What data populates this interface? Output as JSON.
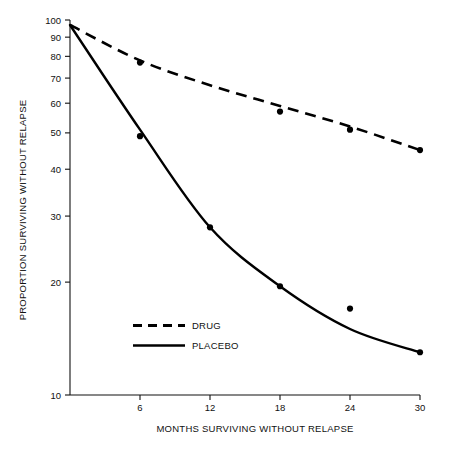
{
  "chart_data": {
    "type": "line",
    "title": "",
    "xlabel": "MONTHS SURVIVING WITHOUT RELAPSE",
    "ylabel": "PROPORTION SURVIVING WITHOUT RELAPSE",
    "yscale": "log",
    "xscale": "linear",
    "xlim": [
      0,
      30
    ],
    "ylim": [
      10,
      100
    ],
    "grid": false,
    "legend_position": "lower-left-inside",
    "x_ticks": [
      6,
      12,
      18,
      24,
      30
    ],
    "x_tick_labels": [
      "6",
      "12",
      "18",
      "24",
      "30"
    ],
    "y_ticks": [
      10,
      20,
      30,
      40,
      50,
      60,
      70,
      80,
      90,
      100
    ],
    "y_tick_labels": [
      "10",
      "20",
      "30",
      "40",
      "50",
      "60",
      "70",
      "80",
      "90",
      "100"
    ],
    "x": [
      0,
      6,
      12,
      18,
      24,
      30
    ],
    "series": [
      {
        "name": "DRUG",
        "style": "dashed",
        "color": "#000000",
        "fit_x": [
          0,
          6,
          12,
          18,
          24,
          30
        ],
        "fit_values": [
          97,
          78,
          67,
          59,
          52,
          45
        ],
        "points_x": [
          6,
          18,
          24,
          30
        ],
        "points_values": [
          77,
          57,
          51,
          45
        ]
      },
      {
        "name": "PLACEBO",
        "style": "solid",
        "color": "#000000",
        "fit_x": [
          0,
          6,
          12,
          18,
          24,
          30
        ],
        "fit_values": [
          97,
          51,
          28,
          19.5,
          15,
          13
        ],
        "points_x": [
          6,
          12,
          18,
          24,
          30
        ],
        "points_values": [
          49,
          28,
          19.5,
          17,
          13
        ]
      }
    ]
  },
  "legend": {
    "items": [
      {
        "label": "DRUG",
        "style": "dashed"
      },
      {
        "label": "PLACEBO",
        "style": "solid"
      }
    ]
  }
}
